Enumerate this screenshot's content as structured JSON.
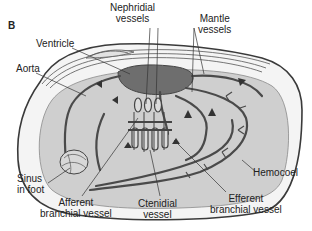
{
  "figure": {
    "panel_label": "B",
    "colors": {
      "shell_outline": "#3a3a3a",
      "mantle_fill": "#f4f4f4",
      "hemocoel_fill": "#cfcfcf",
      "vessel": "#4a4a4a",
      "ventricle": "#6e6e6e",
      "label_text": "#222222",
      "leader_line": "#333333"
    },
    "labels": {
      "nephridial": "Nephridial\nvessels",
      "mantle": "Mantle\nvessels",
      "ventricle": "Ventricle",
      "aorta": "Aorta",
      "hemocoel": "Hemocoel",
      "sinus": "Sinus\nin foot",
      "afferent": "Afferent\nbranchial vessel",
      "ctenidial": "Ctenidial\nvessel",
      "efferent": "Efferent\nbranchial vessel"
    }
  }
}
